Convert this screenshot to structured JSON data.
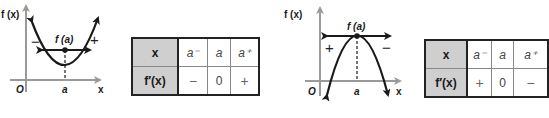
{
  "diagrams": [
    {
      "kind": "local-minimum",
      "axis_y_label": "f (x)",
      "axis_x_label": "x",
      "origin_label": "O",
      "point_x_label": "a",
      "point_label": "f (a)",
      "left_sign": "−",
      "right_sign": "+",
      "table": {
        "row1": {
          "header": "x",
          "cells": [
            "a⁻",
            "a",
            "a⁺"
          ]
        },
        "row2": {
          "header": "f′(x)",
          "cells": [
            "−",
            "0",
            "+"
          ]
        }
      }
    },
    {
      "kind": "local-maximum",
      "axis_y_label": "f (x)",
      "axis_x_label": "x",
      "origin_label": "O",
      "point_x_label": "a",
      "point_label": "f (a)",
      "left_sign": "+",
      "right_sign": "−",
      "table": {
        "row1": {
          "header": "x",
          "cells": [
            "a⁻",
            "a",
            "a⁺"
          ]
        },
        "row2": {
          "header": "f′(x)",
          "cells": [
            "+",
            "0",
            "−"
          ]
        }
      }
    }
  ],
  "colors": {
    "axis": "#9a9a9a",
    "curve": "#1a1a1a",
    "header_fill": "#cfcfcf"
  }
}
